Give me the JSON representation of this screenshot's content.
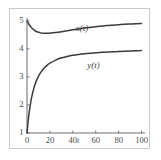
{
  "chart_data": {
    "type": "line",
    "title": "",
    "subtitle": "",
    "xlabel": "t",
    "ylabel": "",
    "xlim": [
      0,
      103
    ],
    "ylim": [
      1,
      5.1
    ],
    "grid": false,
    "legend_position": "inline-curve-labels",
    "xticks": [
      0,
      20,
      40,
      60,
      80,
      100
    ],
    "xtick_labels": [
      "0",
      "20",
      "40",
      "60",
      "80",
      "100"
    ],
    "yticks": [
      1,
      2,
      3,
      4,
      5
    ],
    "ytick_labels": [
      "1",
      "2",
      "3",
      "4",
      "5"
    ],
    "annotations": [
      {
        "text": "x(t)",
        "x": 48,
        "y": 4.62
      },
      {
        "text": "y(t)",
        "x": 58,
        "y": 3.33
      }
    ],
    "series": [
      {
        "name": "x(t)",
        "label": "x(t)",
        "color": "#3b3b3b",
        "x": [
          0,
          2,
          4,
          6,
          8,
          10,
          12,
          14,
          16,
          18,
          20,
          25,
          30,
          35,
          40,
          45,
          50,
          55,
          60,
          65,
          70,
          75,
          80,
          85,
          90,
          95,
          100
        ],
        "values": [
          5.0,
          4.86,
          4.75,
          4.68,
          4.62,
          4.59,
          4.57,
          4.56,
          4.555,
          4.555,
          4.56,
          4.58,
          4.61,
          4.645,
          4.68,
          4.71,
          4.74,
          4.765,
          4.79,
          4.81,
          4.83,
          4.845,
          4.86,
          4.875,
          4.885,
          4.895,
          4.9
        ]
      },
      {
        "name": "y(t)",
        "label": "y(t)",
        "color": "#3b3b3b",
        "x": [
          0,
          1,
          2,
          3,
          4,
          6,
          8,
          10,
          12,
          15,
          18,
          20,
          25,
          30,
          35,
          40,
          45,
          50,
          55,
          60,
          65,
          70,
          75,
          80,
          85,
          90,
          95,
          100
        ],
        "values": [
          1.0,
          1.42,
          1.76,
          2.03,
          2.26,
          2.6,
          2.84,
          3.02,
          3.16,
          3.32,
          3.43,
          3.49,
          3.6,
          3.68,
          3.73,
          3.77,
          3.8,
          3.825,
          3.845,
          3.86,
          3.875,
          3.885,
          3.895,
          3.905,
          3.915,
          3.925,
          3.93,
          3.94
        ]
      }
    ]
  },
  "figure": {
    "frame_color": "#c9c9c9",
    "axis_color": "#5a5a5a",
    "curve_color": "#3b3b3b",
    "background": "#ffffff"
  }
}
